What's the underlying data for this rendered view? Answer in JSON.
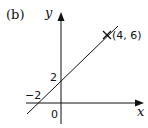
{
  "figure": {
    "part_label": "(b)",
    "x_axis_label": "x",
    "y_axis_label": "y",
    "origin_label": "0",
    "y_intercept_label": "2",
    "x_intercept_label": "−2",
    "point_label": "(4, 6)"
  },
  "line": {
    "equation": "y = x + 2",
    "y_intercept": [
      0,
      2
    ],
    "x_intercept": [
      -2,
      0
    ],
    "marked_point": [
      4,
      6
    ]
  },
  "colors": {
    "ink": "#111111",
    "background": "#ffffff"
  }
}
